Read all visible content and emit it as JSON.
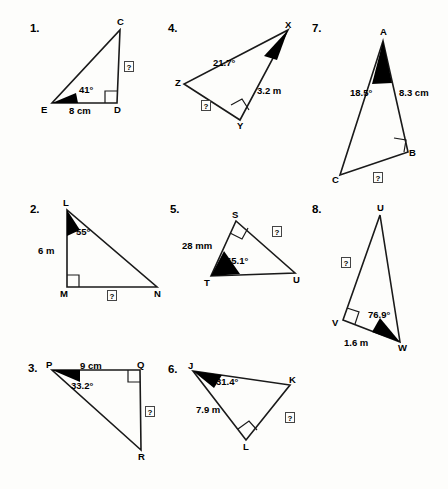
{
  "worksheet": {
    "background": "#fdfdfb",
    "ink": "#1a1a1a",
    "unknown_marker": "?"
  },
  "problems": [
    {
      "number": "1.",
      "vertices": [
        {
          "name": "E",
          "x": 52,
          "y": 103
        },
        {
          "name": "D",
          "x": 117,
          "y": 103
        },
        {
          "name": "C",
          "x": 120,
          "y": 30
        }
      ],
      "angle": {
        "value": "41°",
        "at": "E"
      },
      "given_side": {
        "value": "8 cm",
        "between": "E-D"
      },
      "right_angle_at": "D",
      "unknown_side": {
        "label": "?",
        "between": "D-C"
      }
    },
    {
      "number": "2.",
      "vertices": [
        {
          "name": "L",
          "x": 67,
          "y": 210
        },
        {
          "name": "M",
          "x": 67,
          "y": 287
        },
        {
          "name": "N",
          "x": 157,
          "y": 287
        }
      ],
      "angle": {
        "value": "55°",
        "at": "L"
      },
      "given_side": {
        "value": "6 m",
        "between": "L-M"
      },
      "right_angle_at": "M",
      "unknown_side": {
        "label": "?",
        "between": "M-N"
      }
    },
    {
      "number": "3.",
      "vertices": [
        {
          "name": "P",
          "x": 52,
          "y": 370
        },
        {
          "name": "Q",
          "x": 140,
          "y": 370
        },
        {
          "name": "R",
          "x": 141,
          "y": 450
        }
      ],
      "angle": {
        "value": "33.2°",
        "at": "P"
      },
      "given_side": {
        "value": "9 cm",
        "between": "P-Q"
      },
      "right_angle_at": "Q",
      "unknown_side": {
        "label": "?",
        "between": "Q-R"
      }
    },
    {
      "number": "4.",
      "vertices": [
        {
          "name": "X",
          "x": 184,
          "y": 84
        },
        {
          "name": "Y",
          "x": 240,
          "y": 120
        },
        {
          "name": "Z",
          "x": 288,
          "y": 30
        }
      ],
      "angle": {
        "value": "21.7°",
        "at": "Z"
      },
      "given_side": {
        "value": "3.2 m",
        "between": "Z-Y"
      },
      "right_angle_at": "Y",
      "unknown_side": {
        "label": "?",
        "between": "X-Y"
      }
    },
    {
      "number": "5.",
      "vertices": [
        {
          "name": "S",
          "x": 236,
          "y": 221
        },
        {
          "name": "T",
          "x": 211,
          "y": 276
        },
        {
          "name": "U",
          "x": 295,
          "y": 273
        }
      ],
      "angle": {
        "value": "65.1°",
        "at": "T"
      },
      "given_side": {
        "value": "28 mm",
        "between": "T-S"
      },
      "right_angle_at": "S",
      "unknown_side": {
        "label": "?",
        "between": "S-U"
      }
    },
    {
      "number": "6.",
      "vertices": [
        {
          "name": "J",
          "x": 193,
          "y": 371
        },
        {
          "name": "K",
          "x": 290,
          "y": 385
        },
        {
          "name": "L",
          "x": 246,
          "y": 440
        }
      ],
      "angle": {
        "value": "31.4°",
        "at": "J"
      },
      "given_side": {
        "value": "7.9 m",
        "between": "J-L"
      },
      "right_angle_at": "L",
      "unknown_side": {
        "label": "?",
        "between": "L-K"
      }
    },
    {
      "number": "7.",
      "vertices": [
        {
          "name": "A",
          "x": 383,
          "y": 41
        },
        {
          "name": "B",
          "x": 408,
          "y": 152
        },
        {
          "name": "C",
          "x": 340,
          "y": 175
        }
      ],
      "angle": {
        "value": "18.5°",
        "at": "A"
      },
      "given_side": {
        "value": "8.3 cm",
        "between": "A-B"
      },
      "right_angle_at": "B",
      "unknown_side": {
        "label": "?",
        "between": "C-B"
      }
    },
    {
      "number": "8.",
      "vertices": [
        {
          "name": "U",
          "x": 380,
          "y": 215
        },
        {
          "name": "V",
          "x": 343,
          "y": 320
        },
        {
          "name": "W",
          "x": 400,
          "y": 342
        }
      ],
      "angle": {
        "value": "76.9°",
        "at": "W"
      },
      "given_side": {
        "value": "1.6 m",
        "between": "V-W"
      },
      "right_angle_at": "V",
      "unknown_side": {
        "label": "?",
        "between": "U-V"
      }
    }
  ],
  "labels": {
    "p1_num": "1.",
    "p1_A": "C",
    "p1_B": "D",
    "p1_C": "E",
    "p1_angle": "41°",
    "p1_side": "8 cm",
    "p1_q": "?",
    "p2_num": "2.",
    "p2_A": "L",
    "p2_B": "M",
    "p2_C": "N",
    "p2_angle": "55°",
    "p2_side": "6 m",
    "p2_q": "?",
    "p3_num": "3.",
    "p3_A": "P",
    "p3_B": "Q",
    "p3_C": "R",
    "p3_angle": "33.2°",
    "p3_side": "9 cm",
    "p3_q": "?",
    "p4_num": "4.",
    "p4_A": "X",
    "p4_B": "Y",
    "p4_C": "Z",
    "p4_angle": "21.7°",
    "p4_side": "3.2 m",
    "p4_q": "?",
    "p5_num": "5.",
    "p5_A": "S",
    "p5_B": "T",
    "p5_C": "U",
    "p5_angle": "65.1°",
    "p5_side": "28 mm",
    "p5_q": "?",
    "p6_num": "6.",
    "p6_A": "J",
    "p6_B": "K",
    "p6_C": "L",
    "p6_angle": "31.4°",
    "p6_side": "7.9 m",
    "p6_q": "?",
    "p7_num": "7.",
    "p7_A": "A",
    "p7_B": "B",
    "p7_C": "C",
    "p7_angle": "18.5°",
    "p7_side": "8.3 cm",
    "p7_q": "?",
    "p8_num": "8.",
    "p8_A": "U",
    "p8_B": "V",
    "p8_C": "W",
    "p8_angle": "76.9°",
    "p8_side": "1.6 m",
    "p8_q": "?"
  }
}
